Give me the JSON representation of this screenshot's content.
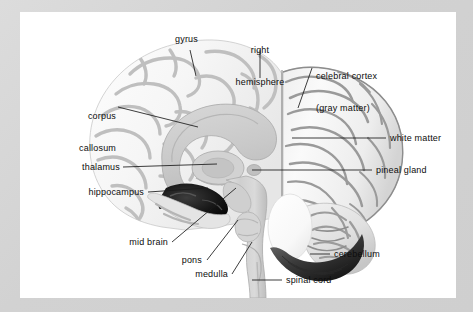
{
  "figure": {
    "background_color": "#d6d6d6",
    "canvas_color": "#ffffff",
    "label_color": "#0d0d0d",
    "leader_color": "#1a1a1a"
  },
  "labels": [
    {
      "id": "gyrus",
      "text": "gyrus",
      "align": "right"
    },
    {
      "id": "right-hemisphere",
      "text": "right\nhemisphere",
      "align": "center"
    },
    {
      "id": "cerebral-cortex",
      "text": "celebral cortex\n(gray matter)",
      "align": "left"
    },
    {
      "id": "corpus-callosum",
      "text": "corpus\ncallosum",
      "align": "right"
    },
    {
      "id": "white-matter",
      "text": "white matter",
      "align": "left"
    },
    {
      "id": "thalamus",
      "text": "thalamus",
      "align": "right"
    },
    {
      "id": "pineal-gland",
      "text": "pineal gland",
      "align": "left"
    },
    {
      "id": "hippocampus",
      "text": "hippocampus",
      "align": "right"
    },
    {
      "id": "mid-brain",
      "text": "mid brain",
      "align": "right"
    },
    {
      "id": "pons",
      "text": "pons",
      "align": "right"
    },
    {
      "id": "medulla",
      "text": "medulla",
      "align": "right"
    },
    {
      "id": "cerebellum",
      "text": "cerebellum",
      "align": "left"
    },
    {
      "id": "spinal-cord",
      "text": "spinal cord",
      "align": "left"
    }
  ],
  "label_text": {
    "gyrus": "gyrus",
    "right_hemisphere_line1": "right",
    "right_hemisphere_line2": "hemisphere",
    "cerebral_cortex_line1": "celebral cortex",
    "cerebral_cortex_line2": "(gray matter)",
    "corpus_callosum_line1": "corpus",
    "corpus_callosum_line2": "callosum",
    "white_matter": "white matter",
    "thalamus": "thalamus",
    "pineal_gland": "pineal gland",
    "hippocampus": "hippocampus",
    "mid_brain": "mid brain",
    "pons": "pons",
    "medulla": "medulla",
    "cerebellum": "cerebellum",
    "spinal_cord": "spinal cord"
  }
}
